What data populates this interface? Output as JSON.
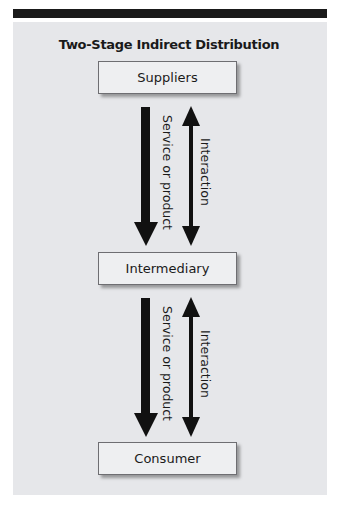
{
  "diagram": {
    "title": "Two-Stage Indirect Distribution",
    "nodes": [
      {
        "id": "suppliers",
        "label": "Suppliers"
      },
      {
        "id": "intermediary",
        "label": "Intermediary"
      },
      {
        "id": "consumer",
        "label": "Consumer"
      }
    ],
    "links": [
      {
        "from": "suppliers",
        "to": "intermediary",
        "flow_label": "Service or product",
        "interaction_label": "Interaction"
      },
      {
        "from": "intermediary",
        "to": "consumer",
        "flow_label": "Service or product",
        "interaction_label": "Interaction"
      }
    ],
    "colors": {
      "panel": "#e6e7ea",
      "box": "#eeeff1",
      "box_border": "#6e6e72",
      "arrow": "#111111",
      "top_bar": "#1a1a1a"
    }
  }
}
